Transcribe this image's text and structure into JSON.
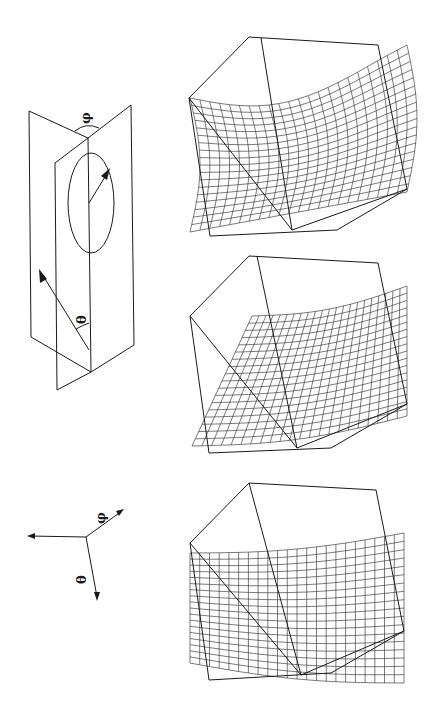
{
  "figure": {
    "orientation": "rotated 90 degrees",
    "planes_diagram": {
      "angle_labels": {
        "theta": "θ",
        "phi": "φ"
      }
    },
    "axes_diagram": {
      "axis_labels": {
        "theta": "θ",
        "phi": "φ"
      }
    },
    "panels": [
      {
        "id": "top",
        "description": "wireframe surface in cube, folded sheet"
      },
      {
        "id": "middle",
        "description": "wireframe surface in cube, curved sheet"
      },
      {
        "id": "bottom",
        "description": "wireframe surface in cube, twisted sheet"
      }
    ],
    "colors": {
      "ink": "#1a1a1a",
      "background": "#ffffff"
    }
  }
}
